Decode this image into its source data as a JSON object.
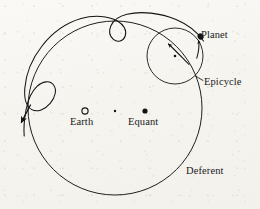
{
  "figure": {
    "type": "astronomical-diagram",
    "background_color": "#f5f4ef",
    "ink_color": "#141414"
  },
  "labels": {
    "planet": "Planet",
    "epicycle": "Epicycle",
    "deferent": "Deferent",
    "earth": "Earth",
    "equant": "Equant"
  },
  "markers": {
    "earth": {
      "name": "earth-marker",
      "style": "hollow-circle",
      "cx": 85,
      "cy": 111,
      "r": 3.1
    },
    "deferent_center": {
      "name": "deferent-center-marker",
      "style": "small-dot",
      "cx": 115,
      "cy": 111,
      "r": 1.2
    },
    "equant": {
      "name": "equant-marker",
      "style": "filled-dot",
      "cx": 145,
      "cy": 111,
      "r": 2.6
    },
    "epicycle_center": {
      "name": "epicycle-center-marker",
      "style": "small-dot",
      "cx": 175,
      "cy": 56,
      "r": 1.3
    },
    "planet": {
      "name": "planet-marker",
      "style": "filled-blob",
      "cx": 200.5,
      "cy": 36.5,
      "r": 2.7
    }
  },
  "geometry": {
    "deferent_circle": {
      "cx": 115,
      "cy": 108,
      "r": 87
    },
    "epicycle_circle": {
      "cx": 175,
      "cy": 56,
      "r": 28
    },
    "epicyclic_path_description": "Looping epicyclic trajectory with two retrograde cusps, terminating in an arrowhead at lower left"
  },
  "arrows": {
    "epicycle_rotation": {
      "name": "epicycle-rotation-arrow",
      "direction": "counter-clockwise, pointing up-left"
    },
    "planet_motion": {
      "name": "planet-motion-arrow",
      "direction": "pointing up toward planet"
    },
    "path_terminus": {
      "name": "epicyclic-path-arrow",
      "direction": "pointing down-left"
    }
  }
}
